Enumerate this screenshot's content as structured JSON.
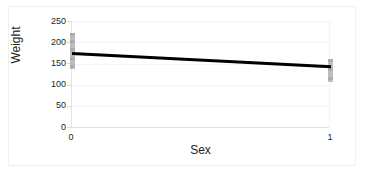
{
  "chart_data": {
    "type": "line",
    "title": "",
    "xlabel": "Sex",
    "ylabel": "Weight",
    "x": [
      0,
      1
    ],
    "values": [
      174,
      143
    ],
    "series": [
      {
        "name": "Weight regression line",
        "values": [
          174,
          143
        ]
      }
    ],
    "xlim": [
      0,
      1
    ],
    "ylim": [
      0,
      250
    ],
    "xticks": [
      "0",
      "1"
    ],
    "yticks": [
      "250",
      "200",
      "150",
      "100",
      "50",
      "0"
    ],
    "ytick_values": [
      250,
      200,
      150,
      100,
      50,
      0
    ],
    "grid": true,
    "legend": "none",
    "point_clusters": [
      {
        "x": 0,
        "range_low": 137,
        "range_high": 221,
        "color": "#b4b4b4"
      },
      {
        "x": 1,
        "range_low": 108,
        "range_high": 162,
        "color": "#b4b4b4"
      }
    ],
    "line_color": "#000000",
    "line_width": 2.5
  },
  "axes": {
    "y_title": "Weight",
    "x_title": "Sex",
    "y_tick_labels": [
      "250",
      "200",
      "150",
      "100",
      "50",
      "0"
    ],
    "x_tick_labels": [
      "0",
      "1"
    ]
  },
  "style": {
    "background": "#ffffff",
    "grid_color": "#f4f4f4",
    "axis_color": "#e0e0e0",
    "text_color": "#231f20",
    "point_color": "#b4b4b4",
    "line_color": "#000000"
  }
}
